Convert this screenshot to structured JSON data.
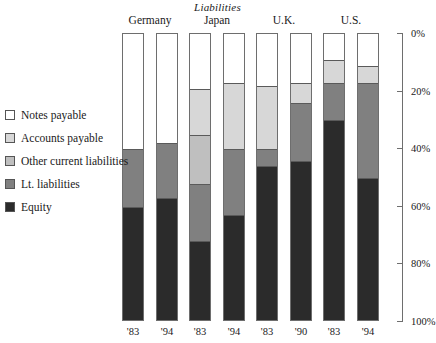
{
  "chart_data": {
    "type": "bar",
    "title": "Liabilities",
    "xlabel": "",
    "ylabel": "",
    "ylim": [
      0,
      100
    ],
    "y_axis_inverted": true,
    "grid": false,
    "legend_position": "left",
    "stacked": true,
    "stack_total": 100,
    "tick_labels": [
      "0%",
      "20%",
      "40%",
      "60%",
      "80%",
      "100%"
    ],
    "tick_values": [
      0,
      20,
      40,
      60,
      80,
      100
    ],
    "groups": [
      {
        "label": "Germany",
        "bars": [
          "'83",
          "'94"
        ]
      },
      {
        "label": "Japan",
        "bars": [
          "'83",
          "'94"
        ]
      },
      {
        "label": "U.K.",
        "bars": [
          "'83",
          "'90"
        ]
      },
      {
        "label": "U.S.",
        "bars": [
          "'83",
          "'94"
        ]
      }
    ],
    "categories": [
      "'83",
      "'94",
      "'83",
      "'94",
      "'83",
      "'90",
      "'83",
      "'94"
    ],
    "series": [
      {
        "name": "Notes payable",
        "color": "#ffffff",
        "values": [
          40,
          38,
          19,
          17,
          18,
          17,
          9,
          11
        ]
      },
      {
        "name": "Accounts payable",
        "color": "#d7d7d7",
        "values": [
          0,
          0,
          16,
          23,
          22,
          7,
          8,
          6
        ]
      },
      {
        "name": "Other current liabilities",
        "color": "#bfbfbf",
        "values": [
          0,
          0,
          17,
          0,
          0,
          0,
          0,
          0
        ]
      },
      {
        "name": "Lt. liabilities",
        "color": "#808080",
        "values": [
          20,
          19,
          20,
          23,
          6,
          20,
          13,
          33
        ]
      },
      {
        "name": "Equity",
        "color": "#2b2b2b",
        "values": [
          40,
          43,
          28,
          37,
          54,
          56,
          70,
          50
        ]
      }
    ]
  },
  "legend": {
    "items": [
      {
        "label": "Notes payable",
        "swatch_name": "swatch-notes-payable",
        "color": "#ffffff"
      },
      {
        "label": "Accounts payable",
        "swatch_name": "swatch-accounts-payable",
        "color": "#d7d7d7"
      },
      {
        "label": "Other current liabilities",
        "swatch_name": "swatch-other-current-liabilities",
        "color": "#bfbfbf"
      },
      {
        "label": "Lt. liabilities",
        "swatch_name": "swatch-lt-liabilities",
        "color": "#808080"
      },
      {
        "label": "Equity",
        "swatch_name": "swatch-equity",
        "color": "#2b2b2b"
      }
    ]
  }
}
